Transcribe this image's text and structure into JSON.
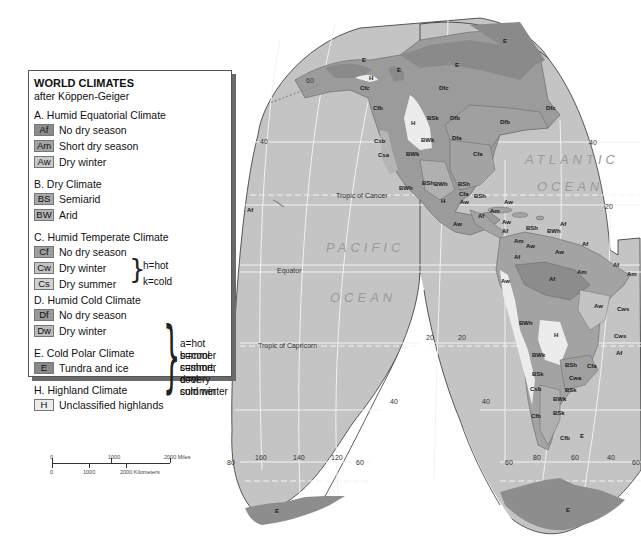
{
  "legend": {
    "title": "WORLD CLIMATES",
    "subtitle": "after Köppen-Geiger",
    "groups": [
      {
        "heading": "A. Humid Equatorial Climate",
        "items": [
          {
            "code": "Af",
            "label": "No dry season",
            "color": "#8c8c8c"
          },
          {
            "code": "Am",
            "label": "Short dry season",
            "color": "#a3a3a3"
          },
          {
            "code": "Aw",
            "label": "Dry winter",
            "color": "#c9c9c9"
          }
        ]
      },
      {
        "heading": "B. Dry Climate",
        "items": [
          {
            "code": "BS",
            "label": "Semiarid",
            "color": "#a8a8a8"
          },
          {
            "code": "BW",
            "label": "Arid",
            "color": "#b5b5b5"
          }
        ],
        "notes": [
          "h=hot",
          "k=cold"
        ]
      },
      {
        "heading": "C. Humid Temperate Climate",
        "items": [
          {
            "code": "Cf",
            "label": "No dry season",
            "color": "#9e9e9e"
          },
          {
            "code": "Cw",
            "label": "Dry winter",
            "color": "#c4c4c4"
          },
          {
            "code": "Cs",
            "label": "Dry summer",
            "color": "#d2d2d2"
          }
        ]
      },
      {
        "heading": "D. Humid Cold Climate",
        "items": [
          {
            "code": "Df",
            "label": "No dry season",
            "color": "#999999"
          },
          {
            "code": "Dw",
            "label": "Dry winter",
            "color": "#bdbdbd"
          }
        ]
      },
      {
        "heading": "E. Cold Polar Climate",
        "items": [
          {
            "code": "E",
            "label": "Tundra and ice",
            "color": "#8a8a8a"
          }
        ]
      },
      {
        "heading": "H. Highland Climate",
        "items": [
          {
            "code": "H",
            "label": "Unclassified highlands",
            "color": "#e8e8e8"
          }
        ]
      }
    ],
    "subtype_notes": [
      "a=hot summer",
      "b=cool summer",
      "c=short, cool summer",
      "d=very cold winter"
    ]
  },
  "scale": {
    "miles": {
      "ticks": [
        "0",
        "1000",
        "2000 Miles"
      ]
    },
    "km": {
      "ticks": [
        "0",
        "1000",
        "2000 Kilometers"
      ]
    }
  },
  "map": {
    "colors": {
      "ocean": "#c4c4c4",
      "land": "#9b9b9b",
      "highland": "#ececec",
      "ice": "#8d8d8d",
      "grid": "#f2f2f2",
      "outline": "#333333"
    },
    "oceans": [
      "PACIFIC",
      "OCEAN",
      "ATLANTIC",
      "OCEAN"
    ],
    "lines": {
      "tropic_cancer": "Tropic of Cancer",
      "equator": "Equator",
      "tropic_capricorn": "Tropic of Capricorn"
    },
    "grid_labels": {
      "left_lobe_lat": [
        "60",
        "40",
        "20",
        "40",
        "60"
      ],
      "bottom_long": [
        "80",
        "160",
        "140",
        "120",
        "60",
        "80",
        "60",
        "40",
        "60"
      ],
      "right_lat": [
        "40",
        "20",
        "40"
      ]
    },
    "climate_labels": [
      {
        "t": "E",
        "x": 362,
        "y": 62
      },
      {
        "t": "H",
        "x": 369,
        "y": 80
      },
      {
        "t": "E",
        "x": 397,
        "y": 72
      },
      {
        "t": "Cfc",
        "x": 360,
        "y": 90
      },
      {
        "t": "Dfc",
        "x": 439,
        "y": 90
      },
      {
        "t": "E",
        "x": 455,
        "y": 67
      },
      {
        "t": "E",
        "x": 503,
        "y": 43
      },
      {
        "t": "Cfb",
        "x": 373,
        "y": 110
      },
      {
        "t": "H",
        "x": 411,
        "y": 125
      },
      {
        "t": "BSk",
        "x": 427,
        "y": 120
      },
      {
        "t": "Dfb",
        "x": 450,
        "y": 120
      },
      {
        "t": "Dfb",
        "x": 500,
        "y": 124
      },
      {
        "t": "Dfc",
        "x": 546,
        "y": 110
      },
      {
        "t": "Dfa",
        "x": 452,
        "y": 140
      },
      {
        "t": "Cfa",
        "x": 473,
        "y": 156
      },
      {
        "t": "BWk",
        "x": 421,
        "y": 142
      },
      {
        "t": "Csb",
        "x": 374,
        "y": 143
      },
      {
        "t": "Csa",
        "x": 378,
        "y": 157
      },
      {
        "t": "BWk",
        "x": 406,
        "y": 156
      },
      {
        "t": "BWh",
        "x": 399,
        "y": 190
      },
      {
        "t": "BSh",
        "x": 422,
        "y": 185
      },
      {
        "t": "BWh",
        "x": 434,
        "y": 186
      },
      {
        "t": "BSh",
        "x": 458,
        "y": 186
      },
      {
        "t": "Cfa",
        "x": 459,
        "y": 196
      },
      {
        "t": "BSh",
        "x": 474,
        "y": 198
      },
      {
        "t": "H",
        "x": 441,
        "y": 203
      },
      {
        "t": "Aw",
        "x": 460,
        "y": 204
      },
      {
        "t": "Aw",
        "x": 504,
        "y": 204
      },
      {
        "t": "Af",
        "x": 478,
        "y": 218
      },
      {
        "t": "Am",
        "x": 490,
        "y": 213
      },
      {
        "t": "Aw",
        "x": 453,
        "y": 226
      },
      {
        "t": "Aw",
        "x": 502,
        "y": 224
      },
      {
        "t": "Af",
        "x": 502,
        "y": 233
      },
      {
        "t": "BSh",
        "x": 526,
        "y": 230
      },
      {
        "t": "BWh",
        "x": 547,
        "y": 233
      },
      {
        "t": "Af",
        "x": 560,
        "y": 226
      },
      {
        "t": "Am",
        "x": 514,
        "y": 243
      },
      {
        "t": "Aw",
        "x": 526,
        "y": 248
      },
      {
        "t": "Af",
        "x": 582,
        "y": 246
      },
      {
        "t": "Aw",
        "x": 555,
        "y": 254
      },
      {
        "t": "Af",
        "x": 514,
        "y": 259
      },
      {
        "t": "Am",
        "x": 577,
        "y": 274
      },
      {
        "t": "Af",
        "x": 549,
        "y": 281
      },
      {
        "t": "Af",
        "x": 613,
        "y": 267
      },
      {
        "t": "Am",
        "x": 627,
        "y": 276
      },
      {
        "t": "Aw",
        "x": 501,
        "y": 283
      },
      {
        "t": "Aw",
        "x": 594,
        "y": 308
      },
      {
        "t": "Cws",
        "x": 617,
        "y": 311
      },
      {
        "t": "Cws",
        "x": 614,
        "y": 338
      },
      {
        "t": "Af",
        "x": 616,
        "y": 355
      },
      {
        "t": "BWh",
        "x": 519,
        "y": 325
      },
      {
        "t": "H",
        "x": 554,
        "y": 337
      },
      {
        "t": "BWk",
        "x": 532,
        "y": 357
      },
      {
        "t": "BSh",
        "x": 565,
        "y": 367
      },
      {
        "t": "Cfa",
        "x": 587,
        "y": 368
      },
      {
        "t": "Cwa",
        "x": 569,
        "y": 380
      },
      {
        "t": "BSk",
        "x": 532,
        "y": 376
      },
      {
        "t": "BSk",
        "x": 565,
        "y": 392
      },
      {
        "t": "Csb",
        "x": 530,
        "y": 391
      },
      {
        "t": "BWk",
        "x": 553,
        "y": 401
      },
      {
        "t": "BSk",
        "x": 553,
        "y": 415
      },
      {
        "t": "Cfb",
        "x": 531,
        "y": 418
      },
      {
        "t": "Cfb",
        "x": 560,
        "y": 440
      },
      {
        "t": "E",
        "x": 580,
        "y": 438
      },
      {
        "t": "Af",
        "x": 247,
        "y": 212
      },
      {
        "t": "E",
        "x": 275,
        "y": 513
      },
      {
        "t": "E",
        "x": 566,
        "y": 512
      }
    ]
  }
}
